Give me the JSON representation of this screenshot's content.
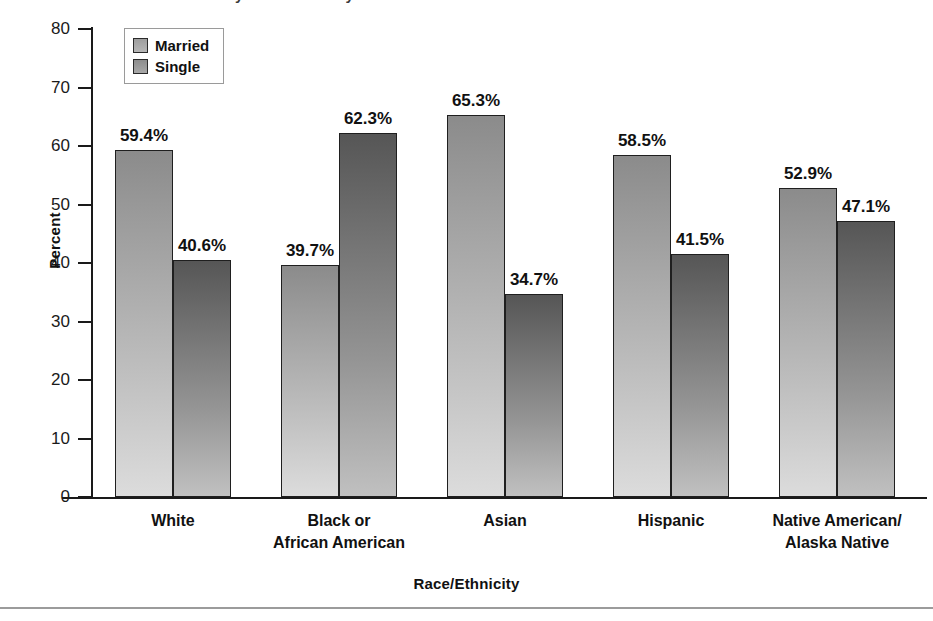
{
  "figure": {
    "title_clipped": "Marital Status by Race/Ethnicity",
    "x_axis_title": "Race/Ethnicity",
    "y_axis_title": "Percent"
  },
  "legend": {
    "position": "top-left-inside",
    "entries": [
      {
        "label": "Married",
        "swatch": "married-swatch",
        "color": "#a8a8a8"
      },
      {
        "label": "Single",
        "swatch": "single-swatch",
        "color": "#7a7a7a"
      }
    ]
  },
  "axis": {
    "y_ticks": [
      "80",
      "70",
      "60",
      "50",
      "40",
      "30",
      "20",
      "10",
      "0"
    ],
    "y_tick_values": [
      80,
      70,
      60,
      50,
      40,
      30,
      20,
      10,
      0
    ]
  },
  "groups": [
    {
      "label_line1": "White",
      "label_line2": ""
    },
    {
      "label_line1": "Black or",
      "label_line2": "African American"
    },
    {
      "label_line1": "Asian",
      "label_line2": ""
    },
    {
      "label_line1": "Hispanic",
      "label_line2": ""
    },
    {
      "label_line1": "Native American/",
      "label_line2": "Alaska Native"
    }
  ],
  "bars": [
    {
      "group": 0,
      "series": "Married",
      "value": 59.4,
      "label": "59.4%"
    },
    {
      "group": 0,
      "series": "Single",
      "value": 40.6,
      "label": "40.6%"
    },
    {
      "group": 1,
      "series": "Married",
      "value": 39.7,
      "label": "39.7%"
    },
    {
      "group": 1,
      "series": "Single",
      "value": 62.3,
      "label": "62.3%"
    },
    {
      "group": 2,
      "series": "Married",
      "value": 65.3,
      "label": "65.3%"
    },
    {
      "group": 2,
      "series": "Single",
      "value": 34.7,
      "label": "34.7%"
    },
    {
      "group": 3,
      "series": "Married",
      "value": 58.5,
      "label": "58.5%"
    },
    {
      "group": 3,
      "series": "Single",
      "value": 41.5,
      "label": "41.5%"
    },
    {
      "group": 4,
      "series": "Married",
      "value": 52.9,
      "label": "52.9%"
    },
    {
      "group": 4,
      "series": "Single",
      "value": 47.1,
      "label": "47.1%"
    }
  ],
  "chart_data": {
    "type": "bar",
    "title": "Marital Status by Race/Ethnicity",
    "xlabel": "Race/Ethnicity",
    "ylabel": "Percent",
    "ylim": [
      0,
      80
    ],
    "ytick_step": 10,
    "grid": false,
    "legend_position": "upper left (inside plot)",
    "categories": [
      "White",
      "Black or African American",
      "Asian",
      "Hispanic",
      "Native American/Alaska Native"
    ],
    "series": [
      {
        "name": "Married",
        "values": [
          59.4,
          39.7,
          65.3,
          58.5,
          52.9
        ],
        "color": "#a8a8a8"
      },
      {
        "name": "Single",
        "values": [
          40.6,
          62.3,
          34.7,
          41.5,
          47.1
        ],
        "color": "#7a7a7a"
      }
    ],
    "data_labels": [
      [
        "59.4%",
        "39.7%",
        "65.3%",
        "58.5%",
        "52.9%"
      ],
      [
        "40.6%",
        "62.3%",
        "34.7%",
        "41.5%",
        "47.1%"
      ]
    ],
    "value_unit": "percent"
  }
}
